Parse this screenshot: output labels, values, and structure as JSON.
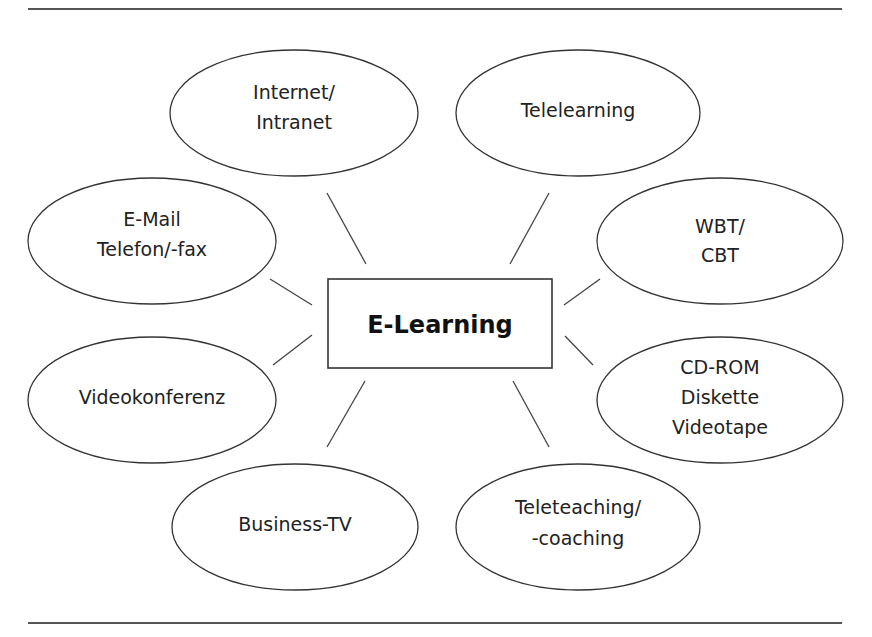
{
  "diagram": {
    "title": "E-Learning",
    "center": {
      "label": "E-Learning",
      "x": 328,
      "y": 279,
      "width": 224,
      "height": 89
    },
    "rules": [
      {
        "x1": 28,
        "y1": 9,
        "x2": 842,
        "y2": 9
      },
      {
        "x1": 28,
        "y1": 623,
        "x2": 842,
        "y2": 623
      }
    ],
    "nodes": [
      {
        "id": "internet",
        "lines": [
          "Internet/",
          "Intranet"
        ],
        "cx": 294,
        "cy": 113,
        "rx": 124,
        "ry": 63,
        "line_y": [
          99,
          129
        ]
      },
      {
        "id": "telelearning",
        "lines": [
          "Telelearning"
        ],
        "cx": 578,
        "cy": 113,
        "rx": 122,
        "ry": 63,
        "line_y": [
          117
        ]
      },
      {
        "id": "email",
        "lines": [
          "E-Mail",
          "Telefon/-fax"
        ],
        "cx": 152,
        "cy": 241,
        "rx": 124,
        "ry": 63,
        "line_y": [
          226,
          256
        ]
      },
      {
        "id": "wbt",
        "lines": [
          "WBT/",
          "CBT"
        ],
        "cx": 720,
        "cy": 241,
        "rx": 123,
        "ry": 63,
        "line_y": [
          233,
          262
        ]
      },
      {
        "id": "videokonferenz",
        "lines": [
          "Videokonferenz"
        ],
        "cx": 152,
        "cy": 400,
        "rx": 124,
        "ry": 63,
        "line_y": [
          404
        ]
      },
      {
        "id": "cdrom",
        "lines": [
          "CD-ROM",
          "Diskette",
          "Videotape"
        ],
        "cx": 720,
        "cy": 400,
        "rx": 123,
        "ry": 63,
        "line_y": [
          374,
          404,
          434
        ]
      },
      {
        "id": "businesstv",
        "lines": [
          "Business-TV"
        ],
        "cx": 295,
        "cy": 527,
        "rx": 123,
        "ry": 63,
        "line_y": [
          531
        ]
      },
      {
        "id": "teleteaching",
        "lines": [
          "Teleteaching/",
          "-coaching"
        ],
        "cx": 578,
        "cy": 527,
        "rx": 122,
        "ry": 63,
        "line_y": [
          514,
          545
        ]
      }
    ],
    "connectors": [
      {
        "to": "internet",
        "x1": 327,
        "y1": 193,
        "x2": 366,
        "y2": 264
      },
      {
        "to": "email",
        "x1": 270,
        "y1": 279,
        "x2": 312,
        "y2": 305
      },
      {
        "to": "telelearning",
        "x1": 549,
        "y1": 193,
        "x2": 510,
        "y2": 264
      },
      {
        "to": "wbt",
        "x1": 600,
        "y1": 279,
        "x2": 564,
        "y2": 305
      },
      {
        "to": "videokonferenz",
        "x1": 312,
        "y1": 335,
        "x2": 273,
        "y2": 365
      },
      {
        "to": "businesstv",
        "x1": 365,
        "y1": 381,
        "x2": 327,
        "y2": 447
      },
      {
        "to": "cdrom",
        "x1": 565,
        "y1": 336,
        "x2": 593,
        "y2": 365
      },
      {
        "to": "teleteaching",
        "x1": 513,
        "y1": 381,
        "x2": 549,
        "y2": 447
      }
    ]
  }
}
